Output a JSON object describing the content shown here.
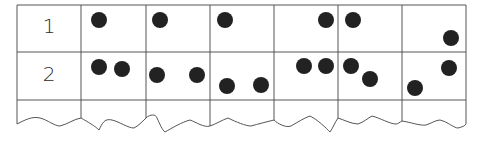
{
  "table": {
    "rows": [
      {
        "label": "1",
        "dots": [
          [
            99,
            20
          ],
          [
            160,
            20
          ],
          [
            225,
            20
          ],
          [
            326,
            20
          ],
          [
            353,
            20
          ],
          [
            451,
            38
          ]
        ]
      },
      {
        "label": "2",
        "dots": [
          [
            99,
            67
          ],
          [
            122,
            69
          ],
          [
            157,
            75
          ],
          [
            197,
            75
          ],
          [
            227,
            86
          ],
          [
            261,
            85
          ],
          [
            304,
            66
          ],
          [
            326,
            66
          ],
          [
            351,
            66
          ],
          [
            370,
            79
          ],
          [
            415,
            88
          ],
          [
            449,
            68
          ]
        ]
      }
    ],
    "columns_x": [
      17,
      81,
      146,
      210,
      274,
      338,
      402,
      466
    ],
    "rows_y": [
      5,
      52,
      100
    ],
    "dot_color": "#222222",
    "line_color": "#555555",
    "dot_radius": 8
  }
}
